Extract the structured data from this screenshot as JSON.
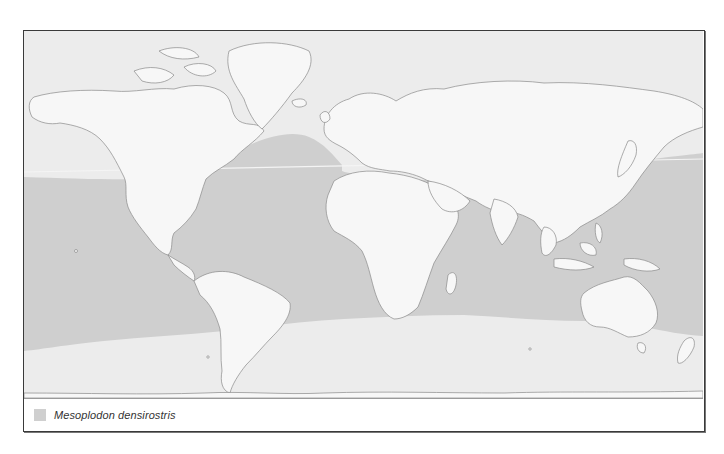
{
  "map": {
    "type": "species-range-map",
    "projection": "world",
    "colors": {
      "ocean": "#ececec",
      "range": "#cfcfcf",
      "land": "#f7f7f7",
      "coastline": "#8a8a8a",
      "frame": "#3a3a3a"
    }
  },
  "legend": {
    "items": [
      {
        "label": "Mesoplodon densirostris",
        "swatch_color": "#cfcfcf"
      }
    ]
  }
}
